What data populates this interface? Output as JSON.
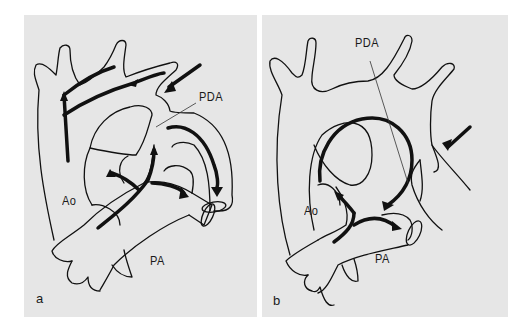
{
  "figure": {
    "panels": [
      {
        "id": "a",
        "letter": "a",
        "labels": {
          "aorta": "Ao",
          "pulmonary_artery": "PA",
          "ductus": "PDA"
        }
      },
      {
        "id": "b",
        "letter": "b",
        "labels": {
          "aorta": "Ao",
          "pulmonary_artery": "PA",
          "ductus": "PDA"
        }
      }
    ],
    "colors": {
      "panel_background": "#e6e6e6",
      "ink": "#111111",
      "page_background": "#ffffff"
    }
  }
}
